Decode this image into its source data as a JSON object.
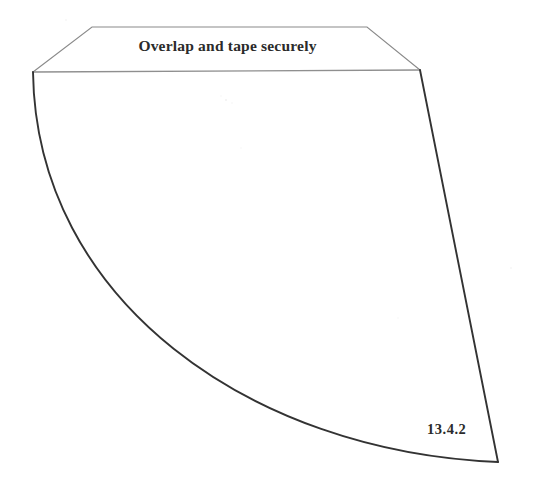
{
  "figure": {
    "type": "papercraft-template",
    "background_color": "#ffffff",
    "tab_instruction": "Overlap and tape securely",
    "figure_number": "13.4.2",
    "colors": {
      "tab_outline": "#8a8a8a",
      "fold_line": "#8f8f8f",
      "body_outline": "#333333",
      "text": "#2b2b2b",
      "page": "#ffffff"
    },
    "geometry": {
      "tab": {
        "name": "glue-tab",
        "shape": "trapezoid",
        "points": [
          [
            92,
            27
          ],
          [
            367,
            27
          ],
          [
            420,
            70
          ],
          [
            33,
            72
          ]
        ],
        "stroke": "#8a8a8a",
        "stroke_width": 1.1
      },
      "fold_line": {
        "name": "fold-line",
        "from": [
          33,
          72
        ],
        "to": [
          420,
          70
        ],
        "stroke": "#8f8f8f",
        "stroke_width": 1.3
      },
      "body": {
        "name": "cone-sector-body",
        "left_arc": {
          "from": [
            33,
            72
          ],
          "to": [
            498,
            462
          ],
          "control_1": [
            36,
            300
          ],
          "control_2": [
            250,
            452
          ]
        },
        "right_edge": {
          "from": [
            420,
            70
          ],
          "to": [
            498,
            462
          ]
        },
        "stroke": "#333333",
        "stroke_width": 1.9
      },
      "traced_points": {
        "left_arc_samples": [
          [
            33,
            72
          ],
          [
            47,
            180
          ],
          [
            82,
            280
          ],
          [
            128,
            330
          ],
          [
            240,
            420
          ],
          [
            320,
            448
          ],
          [
            345,
            455
          ],
          [
            498,
            462
          ]
        ],
        "right_edge_samples": [
          [
            420,
            70
          ],
          [
            458,
            265
          ],
          [
            498,
            462
          ]
        ]
      }
    }
  }
}
